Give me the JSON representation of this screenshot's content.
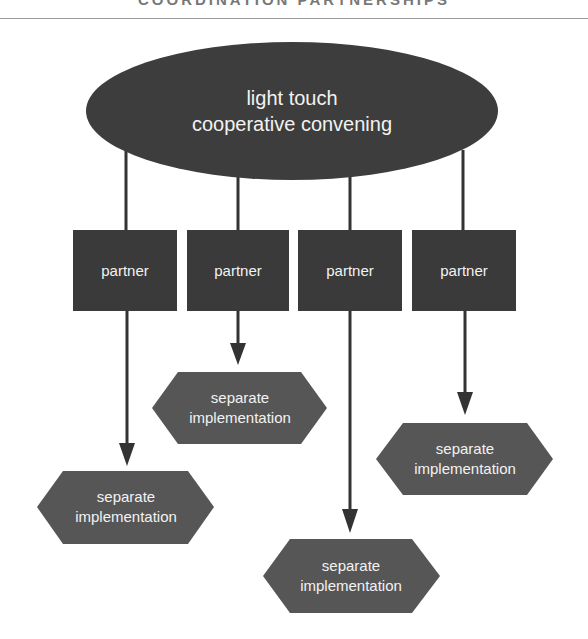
{
  "header": {
    "title": "COORDINATION PARTNERSHIPS"
  },
  "diagram": {
    "hub": {
      "line1": "light touch",
      "line2": "cooperative convening"
    },
    "partners": [
      {
        "label": "partner"
      },
      {
        "label": "partner"
      },
      {
        "label": "partner"
      },
      {
        "label": "partner"
      }
    ],
    "outcomes": [
      {
        "line1": "separate",
        "line2": "implementation"
      },
      {
        "line1": "separate",
        "line2": "implementation"
      },
      {
        "line1": "separate",
        "line2": "implementation"
      },
      {
        "line1": "separate",
        "line2": "implementation"
      }
    ],
    "colors": {
      "hub_fill": "#3d3d3d",
      "partner_fill": "#3a3a3a",
      "outcome_fill": "#565656",
      "line": "#333333",
      "text": "#f2f2f2"
    }
  }
}
